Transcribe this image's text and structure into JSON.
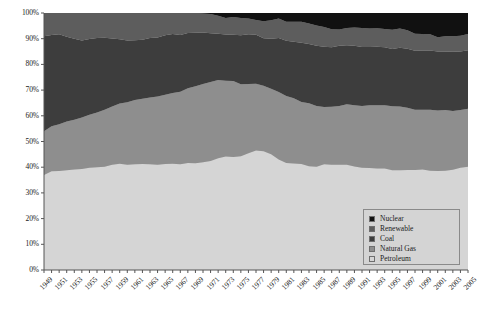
{
  "chart_data": {
    "type": "area",
    "title": "",
    "subtitle": "",
    "xlabel": "",
    "ylabel": "",
    "stacked": true,
    "normalized_percent": true,
    "grid": false,
    "legend_position": "bottom-right",
    "ylim": [
      0,
      100
    ],
    "ytick_labels": [
      "0%",
      "10%",
      "20%",
      "30%",
      "40%",
      "50%",
      "60%",
      "70%",
      "80%",
      "90%",
      "100%"
    ],
    "ytick_values": [
      0,
      10,
      20,
      30,
      40,
      50,
      60,
      70,
      80,
      90,
      100
    ],
    "xlim": [
      1949,
      2005
    ],
    "x": [
      1949,
      1950,
      1951,
      1952,
      1953,
      1954,
      1955,
      1956,
      1957,
      1958,
      1959,
      1960,
      1961,
      1962,
      1963,
      1964,
      1965,
      1966,
      1967,
      1968,
      1969,
      1970,
      1971,
      1972,
      1973,
      1974,
      1975,
      1976,
      1977,
      1978,
      1979,
      1980,
      1981,
      1982,
      1983,
      1984,
      1985,
      1986,
      1987,
      1988,
      1989,
      1990,
      1991,
      1992,
      1993,
      1994,
      1995,
      1996,
      1997,
      1998,
      1999,
      2000,
      2001,
      2002,
      2003,
      2004,
      2005
    ],
    "xtick_labels": [
      "1949",
      "1951",
      "1953",
      "1955",
      "1957",
      "1959",
      "1961",
      "1963",
      "1965",
      "1967",
      "1969",
      "1971",
      "1973",
      "1975",
      "1977",
      "1979",
      "1981",
      "1983",
      "1985",
      "1987",
      "1989",
      "1991",
      "1993",
      "1995",
      "1997",
      "1999",
      "2001",
      "2003",
      "2005"
    ],
    "series": [
      {
        "name": "Petroleum",
        "color": "#d5d5d5",
        "values": [
          37.0,
          38.4,
          38.5,
          38.8,
          39.1,
          39.3,
          39.8,
          40.0,
          40.2,
          41.0,
          41.3,
          41.0,
          41.1,
          41.2,
          41.1,
          41.0,
          41.2,
          41.3,
          41.1,
          41.6,
          41.5,
          41.9,
          42.4,
          43.5,
          44.2,
          44.0,
          44.3,
          45.4,
          46.5,
          46.2,
          45.0,
          43.0,
          41.6,
          41.4,
          41.2,
          40.4,
          40.2,
          41.1,
          41.0,
          41.0,
          41.0,
          40.3,
          39.8,
          39.7,
          39.5,
          39.5,
          38.8,
          38.8,
          38.9,
          38.9,
          39.1,
          38.6,
          38.5,
          38.6,
          39.0,
          39.8,
          40.2
        ]
      },
      {
        "name": "Natural Gas",
        "color": "#8e8e8e",
        "values": [
          17.0,
          17.5,
          18.2,
          19.0,
          19.4,
          20.0,
          20.6,
          21.3,
          22.2,
          22.6,
          23.5,
          24.3,
          25.0,
          25.4,
          26.0,
          26.5,
          27.0,
          27.6,
          28.3,
          29.1,
          30.0,
          30.5,
          30.8,
          30.4,
          29.4,
          29.5,
          28.0,
          27.0,
          26.0,
          25.5,
          25.5,
          26.3,
          26.1,
          25.4,
          24.2,
          24.5,
          23.6,
          22.3,
          22.5,
          22.8,
          23.5,
          23.8,
          24.0,
          24.4,
          24.6,
          24.6,
          24.9,
          24.8,
          24.2,
          23.5,
          23.3,
          23.8,
          23.6,
          23.7,
          22.9,
          22.5,
          22.5
        ]
      },
      {
        "name": "Coal",
        "color": "#3d3d3d",
        "values": [
          37.0,
          35.5,
          35.0,
          33.0,
          31.5,
          30.0,
          29.5,
          29.0,
          28.0,
          26.5,
          25.0,
          24.0,
          23.3,
          23.0,
          23.2,
          23.0,
          23.1,
          22.9,
          22.0,
          21.5,
          20.8,
          20.0,
          18.9,
          18.0,
          18.0,
          18.0,
          19.0,
          19.3,
          19.0,
          18.5,
          19.5,
          21.0,
          21.5,
          22.0,
          23.0,
          23.0,
          23.5,
          23.5,
          23.2,
          23.5,
          23.0,
          23.2,
          23.0,
          22.7,
          22.8,
          22.6,
          22.3,
          22.9,
          23.0,
          22.9,
          23.0,
          23.0,
          22.9,
          22.7,
          23.0,
          22.7,
          22.8
        ]
      },
      {
        "name": "Renewable",
        "color": "#5d5d5d",
        "values": [
          9.0,
          8.6,
          8.3,
          9.2,
          10.0,
          10.7,
          10.1,
          9.7,
          9.6,
          9.9,
          10.2,
          10.7,
          10.6,
          10.4,
          9.7,
          9.5,
          8.7,
          8.2,
          8.6,
          7.8,
          7.7,
          7.4,
          7.5,
          7.0,
          6.5,
          6.9,
          6.8,
          6.2,
          5.8,
          6.6,
          7.2,
          7.6,
          7.4,
          7.8,
          8.2,
          8.0,
          7.8,
          7.7,
          7.0,
          6.3,
          6.7,
          7.1,
          7.4,
          7.2,
          7.2,
          7.1,
          7.5,
          7.5,
          7.2,
          6.6,
          6.4,
          6.3,
          5.6,
          6.0,
          6.1,
          6.1,
          6.3
        ]
      },
      {
        "name": "Nuclear",
        "color": "#111111",
        "values": [
          0.0,
          0.0,
          0.0,
          0.0,
          0.0,
          0.0,
          0.0,
          0.0,
          0.0,
          0.0,
          0.0,
          0.0,
          0.0,
          0.0,
          0.0,
          0.0,
          0.0,
          0.0,
          0.0,
          0.0,
          0.0,
          0.2,
          0.4,
          1.1,
          1.9,
          1.6,
          1.9,
          2.1,
          2.7,
          3.2,
          2.8,
          2.1,
          3.4,
          3.4,
          3.4,
          4.1,
          4.9,
          5.4,
          6.3,
          6.4,
          5.8,
          5.6,
          5.8,
          6.0,
          5.9,
          6.2,
          6.5,
          6.0,
          6.7,
          8.1,
          8.2,
          8.3,
          9.4,
          9.0,
          9.0,
          8.9,
          8.2
        ]
      }
    ],
    "legend_entries": [
      {
        "label": "Nuclear",
        "color": "#111111"
      },
      {
        "label": "Renewable",
        "color": "#5d5d5d"
      },
      {
        "label": "Coal",
        "color": "#3d3d3d"
      },
      {
        "label": "Natural Gas",
        "color": "#8e8e8e"
      },
      {
        "label": "Petroleum",
        "color": "#d5d5d5"
      }
    ],
    "plot_background": "#c9c9c9",
    "axis_color": "#555555"
  }
}
